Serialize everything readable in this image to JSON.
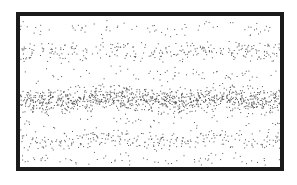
{
  "diagram": {
    "type": "stipple-density-bands",
    "frame": {
      "x": 16,
      "y": 12,
      "width": 268,
      "height": 159,
      "border_px": 4,
      "border_color": "#1a1a1a"
    },
    "dot_color": "#555555",
    "background": "#ffffff",
    "bands": [
      {
        "name": "rarefaction-top",
        "y0": 2,
        "y1": 20,
        "density": 0.06
      },
      {
        "name": "compression-upper",
        "y0": 24,
        "y1": 46,
        "density": 0.2
      },
      {
        "name": "rarefaction-upper",
        "y0": 48,
        "y1": 68,
        "density": 0.05
      },
      {
        "name": "compression-center",
        "y0": 68,
        "y1": 98,
        "density": 0.55
      },
      {
        "name": "rarefaction-lower",
        "y0": 98,
        "y1": 112,
        "density": 0.05
      },
      {
        "name": "compression-lower",
        "y0": 112,
        "y1": 134,
        "density": 0.2
      },
      {
        "name": "rarefaction-bottom",
        "y0": 136,
        "y1": 151,
        "density": 0.07
      }
    ]
  }
}
